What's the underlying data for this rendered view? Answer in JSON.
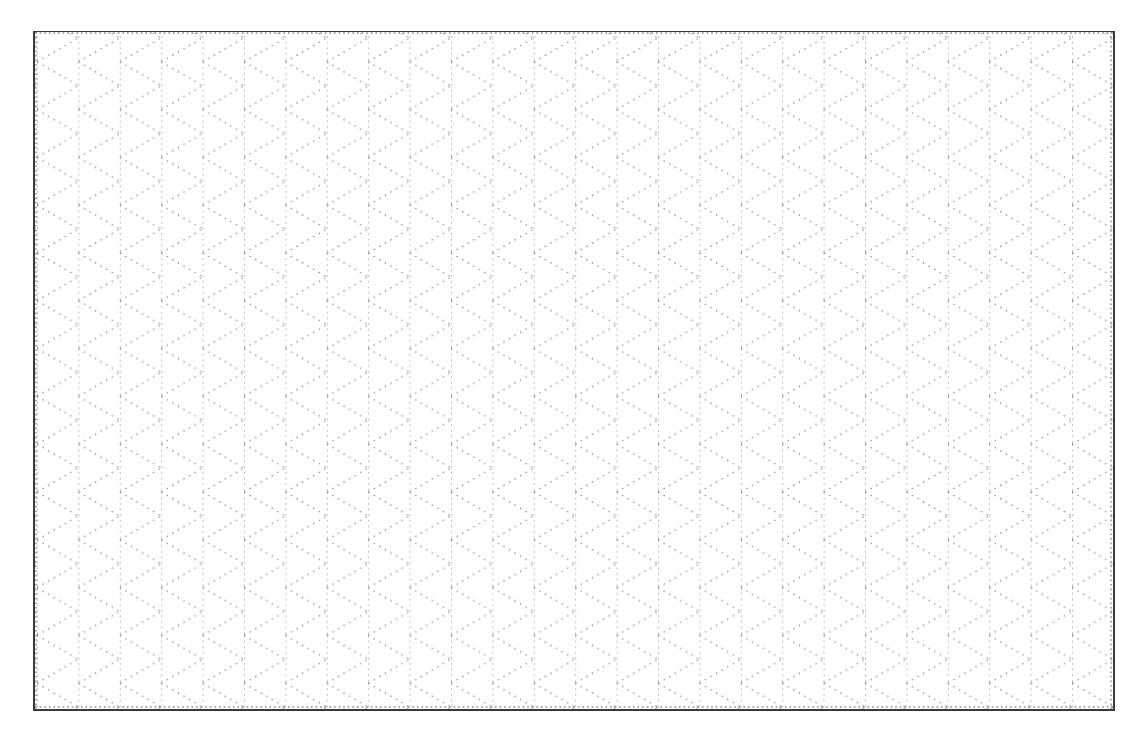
{
  "page": {
    "type": "isometric-dot-grid-paper",
    "caption": ""
  },
  "grid": {
    "column_spacing_px": 41.4,
    "crossing_period_px": 47.8,
    "line_angle_deg": 30,
    "line_style": "dotted",
    "line_color": "#8a8a8a",
    "border_color": "#3a3a3a",
    "background_color": "#ffffff"
  }
}
